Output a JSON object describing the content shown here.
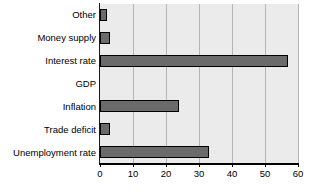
{
  "chart_data": {
    "type": "bar",
    "orientation": "horizontal",
    "title": "",
    "subtitle": "",
    "xlabel": "",
    "ylabel": "",
    "categories": [
      "Other",
      "Money supply",
      "Interest rate",
      "GDP",
      "Inflation",
      "Trade deficit",
      "Unemployment rate"
    ],
    "values": [
      2,
      3,
      57,
      0,
      24,
      3,
      33
    ],
    "xlim": [
      0,
      60
    ],
    "xticks": [
      0,
      10,
      20,
      30,
      40,
      50,
      60
    ],
    "xtick_labels": [
      "0",
      "10",
      "20",
      "30",
      "40",
      "50",
      "60"
    ],
    "grid": "vertical",
    "legend": null,
    "annotations": [],
    "colors": {
      "bar_fill": "#6b6b6b",
      "bar_border": "#000000",
      "plot_background": "#ebebeb",
      "gridline": "#b4b4b4",
      "axis": "#000000",
      "text": "#000000",
      "page_background": "#ffffff"
    }
  }
}
